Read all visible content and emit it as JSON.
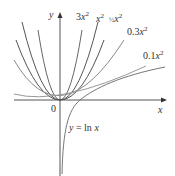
{
  "figure": {
    "axes": {
      "x_label": "x",
      "y_label": "y",
      "origin_label": "0"
    },
    "curves": [
      {
        "label": "3x²",
        "label_coef": "3",
        "a": 3
      },
      {
        "label": "x²",
        "label_coef": "",
        "a": 1
      },
      {
        "label": "½x²",
        "label_coef": "½",
        "a": 0.5
      },
      {
        "label": "0.3x²",
        "label_coef": "0.3",
        "a": 0.3
      },
      {
        "label": "0.1x²",
        "label_coef": "0.1",
        "a": 0.1
      }
    ],
    "log_curve": {
      "label": "y = ln x"
    }
  }
}
